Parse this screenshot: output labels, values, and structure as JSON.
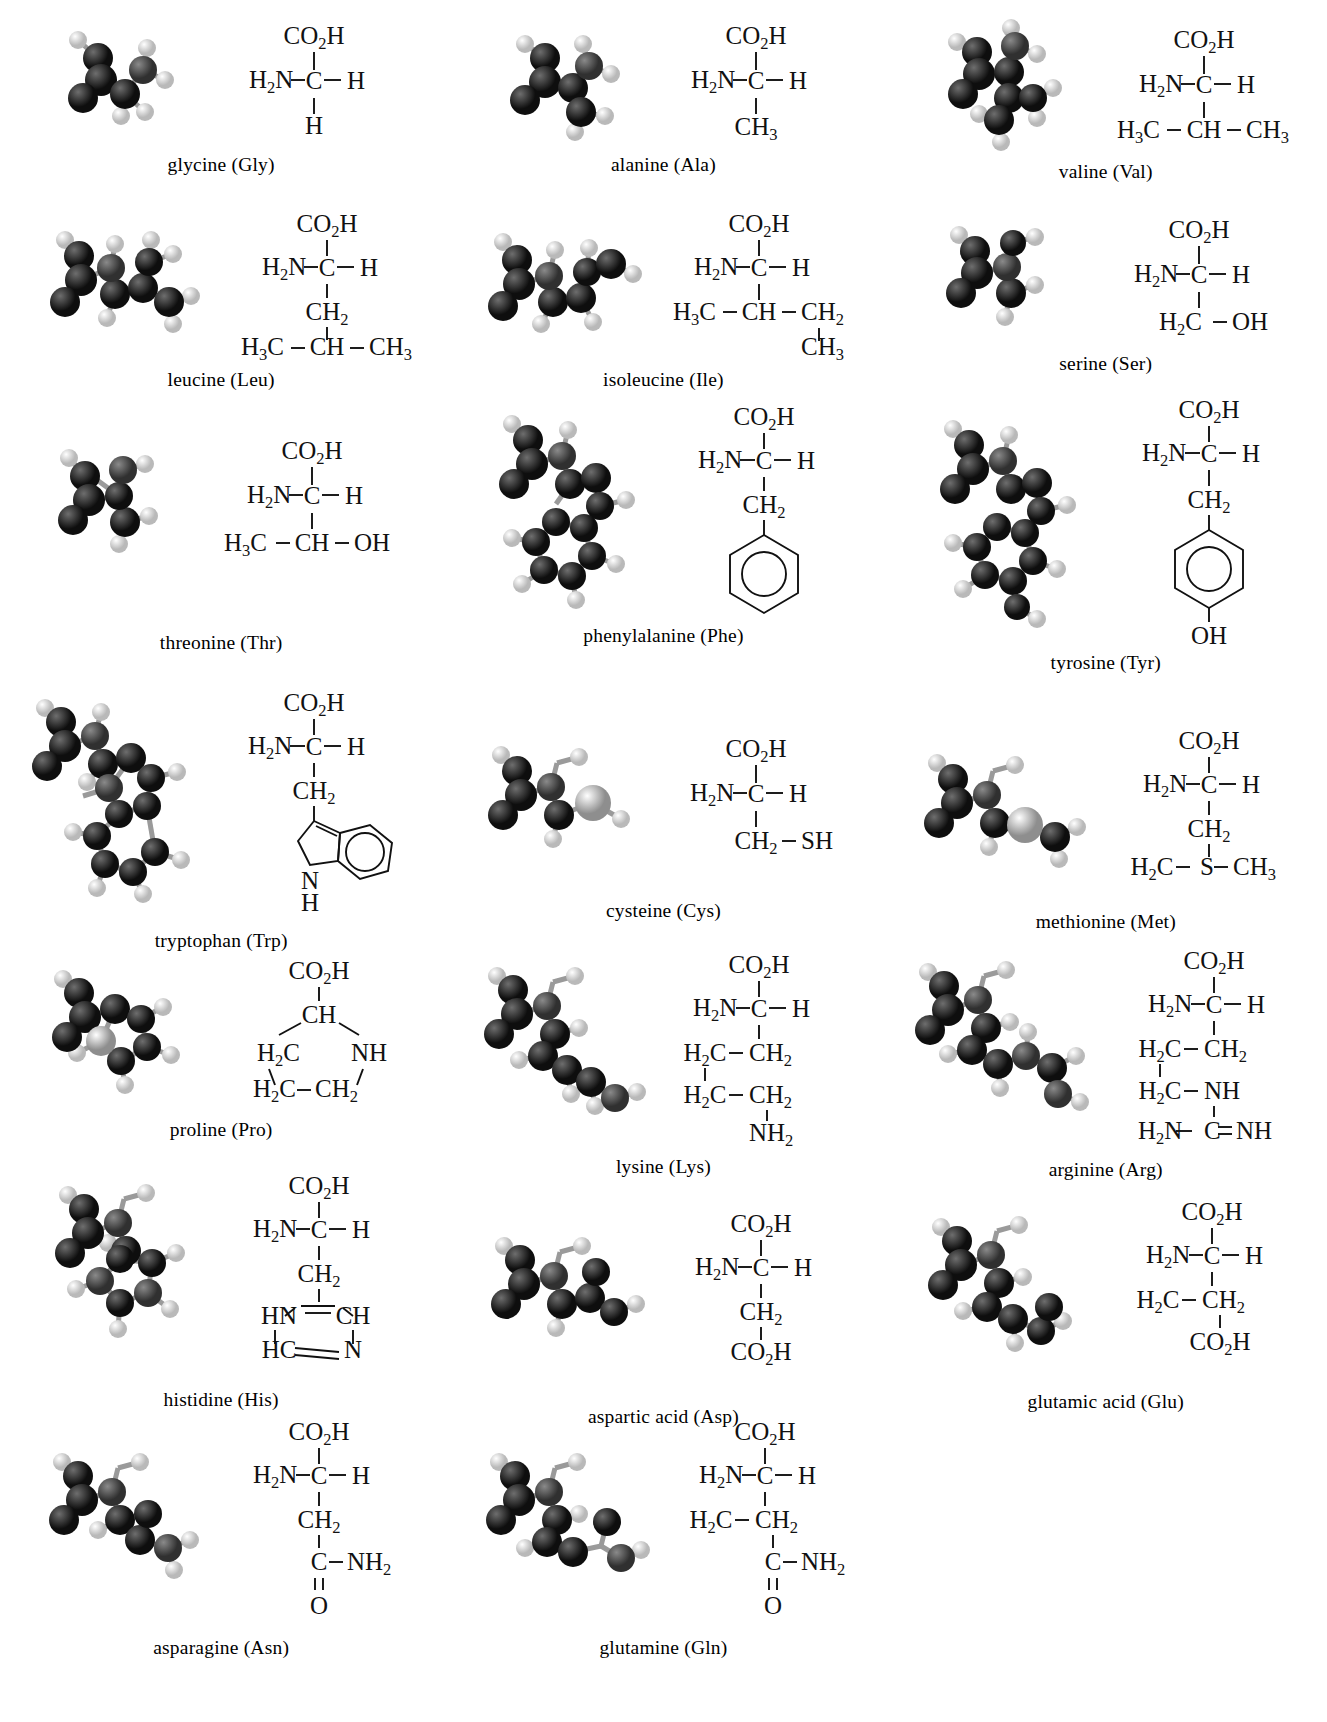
{
  "figure": {
    "kind": "amino-acid-structure-chart",
    "columns": 3,
    "rows": 7,
    "total_items": 20,
    "model_style": "grayscale ball-and-stick space model",
    "colors": {
      "background": "#ffffff",
      "text": "#111111",
      "bond_line": "#111111",
      "atom_carbon": "#1b1b1b",
      "atom_hydrogen": "#e8e8e8",
      "atom_nitrogen": "#4a4a4a",
      "atom_oxygen": "#2b2b2b",
      "atom_sulfur": "#bdbdbd"
    }
  },
  "amino_acids": [
    {
      "name": "glycine",
      "abbr": "Gly",
      "caption": "glycine (Gly)",
      "formula": {
        "top": "CO2H",
        "left": "H2N",
        "center": "C",
        "right": "H",
        "chain": [
          "H"
        ]
      },
      "model": {
        "atoms": 10,
        "heavy": 5,
        "sulfur": false
      }
    },
    {
      "name": "alanine",
      "abbr": "Ala",
      "caption": "alanine (Ala)",
      "formula": {
        "top": "CO2H",
        "left": "H2N",
        "center": "C",
        "right": "H",
        "chain": [
          "CH3"
        ]
      },
      "model": {
        "atoms": 13,
        "heavy": 6,
        "sulfur": false
      }
    },
    {
      "name": "valine",
      "abbr": "Val",
      "caption": "valine (Val)",
      "formula": {
        "top": "CO2H",
        "left": "H2N",
        "center": "C",
        "right": "H",
        "chain": [
          "H3C-CH-CH3"
        ]
      },
      "model": {
        "atoms": 19,
        "heavy": 8,
        "sulfur": false
      }
    },
    {
      "name": "leucine",
      "abbr": "Leu",
      "caption": "leucine (Leu)",
      "formula": {
        "top": "CO2H",
        "left": "H2N",
        "center": "C",
        "right": "H",
        "chain": [
          "CH2",
          "H3C-CH-CH3"
        ]
      },
      "model": {
        "atoms": 22,
        "heavy": 9,
        "sulfur": false
      }
    },
    {
      "name": "isoleucine",
      "abbr": "Ile",
      "caption": "isoleucine (Ile)",
      "formula": {
        "top": "CO2H",
        "left": "H2N",
        "center": "C",
        "right": "H",
        "chain": [
          "H3C-CH-CH2",
          "CH3"
        ]
      },
      "model": {
        "atoms": 22,
        "heavy": 9,
        "sulfur": false
      }
    },
    {
      "name": "serine",
      "abbr": "Ser",
      "caption": "serine (Ser)",
      "formula": {
        "top": "CO2H",
        "left": "H2N",
        "center": "C",
        "right": "H",
        "chain": [
          "H2C-OH"
        ]
      },
      "model": {
        "atoms": 14,
        "heavy": 6,
        "sulfur": false
      }
    },
    {
      "name": "threonine",
      "abbr": "Thr",
      "caption": "threonine (Thr)",
      "formula": {
        "top": "CO2H",
        "left": "H2N",
        "center": "C",
        "right": "H",
        "chain": [
          "H3C-CH-OH"
        ]
      },
      "model": {
        "atoms": 17,
        "heavy": 8,
        "sulfur": false
      }
    },
    {
      "name": "phenylalanine",
      "abbr": "Phe",
      "caption": "phenylalanine (Phe)",
      "formula": {
        "top": "CO2H",
        "left": "H2N",
        "center": "C",
        "right": "H",
        "chain": [
          "CH2"
        ],
        "ring": "benzene"
      },
      "model": {
        "atoms": 23,
        "heavy": 12,
        "sulfur": false
      }
    },
    {
      "name": "tyrosine",
      "abbr": "Tyr",
      "caption": "tyrosine (Tyr)",
      "formula": {
        "top": "CO2H",
        "left": "H2N",
        "center": "C",
        "right": "H",
        "chain": [
          "CH2"
        ],
        "ring": "benzene",
        "ring_substituent": "OH"
      },
      "model": {
        "atoms": 24,
        "heavy": 13,
        "sulfur": false
      }
    },
    {
      "name": "tryptophan",
      "abbr": "Trp",
      "caption": "tryptophan (Trp)",
      "formula": {
        "top": "CO2H",
        "left": "H2N",
        "center": "C",
        "right": "H",
        "chain": [
          "CH2"
        ],
        "ring": "indole",
        "ring_nh": "N",
        "ring_nh_h": "H"
      },
      "model": {
        "atoms": 27,
        "heavy": 15,
        "sulfur": false
      }
    },
    {
      "name": "cysteine",
      "abbr": "Cys",
      "caption": "cysteine (Cys)",
      "formula": {
        "top": "CO2H",
        "left": "H2N",
        "center": "C",
        "right": "H",
        "chain": [
          "CH2-SH"
        ]
      },
      "model": {
        "atoms": 14,
        "heavy": 6,
        "sulfur": true
      }
    },
    {
      "name": "methionine",
      "abbr": "Met",
      "caption": "methionine (Met)",
      "formula": {
        "top": "CO2H",
        "left": "H2N",
        "center": "C",
        "right": "H",
        "chain": [
          "CH2",
          "H2C-S-CH3"
        ]
      },
      "model": {
        "atoms": 20,
        "heavy": 8,
        "sulfur": true
      }
    },
    {
      "name": "proline",
      "abbr": "Pro",
      "caption": "proline (Pro)",
      "formula": {
        "top": "CO2H",
        "ring": "pyrrolidine",
        "ring_labels": [
          "CH",
          "NH",
          "H2C",
          "H2C",
          "CH2"
        ]
      },
      "model": {
        "atoms": 17,
        "heavy": 8,
        "sulfur": false
      }
    },
    {
      "name": "lysine",
      "abbr": "Lys",
      "caption": "lysine (Lys)",
      "formula": {
        "top": "CO2H",
        "left": "H2N",
        "center": "C",
        "right": "H",
        "chain": [
          "H2C-CH2",
          "H2C-CH2",
          "NH2"
        ]
      },
      "model": {
        "atoms": 24,
        "heavy": 10,
        "sulfur": false
      }
    },
    {
      "name": "arginine",
      "abbr": "Arg",
      "caption": "arginine (Arg)",
      "formula": {
        "top": "CO2H",
        "left": "H2N",
        "center": "C",
        "right": "H",
        "chain": [
          "H2C-CH2",
          "H2C-NH",
          "H2N-C=NH"
        ]
      },
      "model": {
        "atoms": 26,
        "heavy": 12,
        "sulfur": false
      }
    },
    {
      "name": "histidine",
      "abbr": "His",
      "caption": "histidine (His)",
      "formula": {
        "top": "CO2H",
        "left": "H2N",
        "center": "C",
        "right": "H",
        "chain": [
          "CH2"
        ],
        "ring": "imidazole",
        "ring_labels": [
          "HN",
          "CH",
          "HC",
          "N"
        ]
      },
      "model": {
        "atoms": 20,
        "heavy": 11,
        "sulfur": false
      }
    },
    {
      "name": "aspartic acid",
      "abbr": "Asp",
      "caption": "aspartic acid (Asp)",
      "formula": {
        "top": "CO2H",
        "left": "H2N",
        "center": "C",
        "right": "H",
        "chain": [
          "CH2",
          "CO2H"
        ]
      },
      "model": {
        "atoms": 16,
        "heavy": 9,
        "sulfur": false
      }
    },
    {
      "name": "glutamic acid",
      "abbr": "Glu",
      "caption": "glutamic acid (Glu)",
      "formula": {
        "top": "CO2H",
        "left": "H2N",
        "center": "C",
        "right": "H",
        "chain": [
          "H2C-CH2",
          "CO2H"
        ]
      },
      "model": {
        "atoms": 19,
        "heavy": 10,
        "sulfur": false
      }
    },
    {
      "name": "asparagine",
      "abbr": "Asn",
      "caption": "asparagine (Asn)",
      "formula": {
        "top": "CO2H",
        "left": "H2N",
        "center": "C",
        "right": "H",
        "chain": [
          "CH2",
          "C-NH2",
          "O"
        ]
      },
      "model": {
        "atoms": 17,
        "heavy": 9,
        "sulfur": false
      }
    },
    {
      "name": "glutamine",
      "abbr": "Gln",
      "caption": "glutamine (Gln)",
      "formula": {
        "top": "CO2H",
        "left": "H2N",
        "center": "C",
        "right": "H",
        "chain": [
          "H2C-CH2",
          "C-NH2",
          "O"
        ]
      },
      "model": {
        "atoms": 20,
        "heavy": 10,
        "sulfur": false
      }
    }
  ]
}
